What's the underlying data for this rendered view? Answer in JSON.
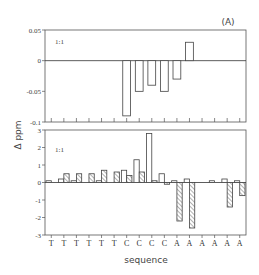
{
  "chart_data": [
    {
      "type": "bar",
      "title": "",
      "panel_label": "(A)",
      "annotation": "1:1",
      "xlabel": "",
      "ylabel": "Δ ppm",
      "ylim": [
        -0.1,
        0.05
      ],
      "yticks": [
        "0.05",
        "0",
        "-0.05",
        "-0.1"
      ],
      "categories": [
        "T",
        "T",
        "T",
        "T",
        "T",
        "T",
        "C",
        "C",
        "C",
        "C",
        "A",
        "A",
        "A",
        "A",
        "A",
        "A"
      ],
      "series": [
        {
          "name": "open",
          "style": "open",
          "values": [
            0,
            0,
            0,
            0,
            0,
            0,
            -0.09,
            -0.05,
            -0.04,
            -0.05,
            -0.03,
            0.03,
            0,
            0,
            0,
            0
          ]
        }
      ]
    },
    {
      "type": "bar",
      "title": "",
      "annotation": "1:1",
      "xlabel": "sequence",
      "ylabel": "Δ ppm",
      "ylim": [
        -3,
        3
      ],
      "yticks": [
        "3",
        "2",
        "1",
        "0",
        "-1",
        "-2",
        "-3"
      ],
      "categories": [
        "T",
        "T",
        "T",
        "T",
        "T",
        "T",
        "C",
        "C",
        "C",
        "C",
        "A",
        "A",
        "A",
        "A",
        "A",
        "A"
      ],
      "series": [
        {
          "name": "open",
          "style": "open",
          "values": [
            0.1,
            0.2,
            0.1,
            0,
            0.1,
            0,
            0.7,
            1.3,
            2.8,
            0.5,
            0.1,
            0.2,
            0,
            0.1,
            0.2,
            0.1
          ]
        },
        {
          "name": "hatched",
          "style": "hatched",
          "values": [
            0,
            0.5,
            0.5,
            0.5,
            0.7,
            0.6,
            0.4,
            0.6,
            0.1,
            -0.1,
            -2.2,
            -2.6,
            0,
            0,
            -1.4,
            -0.75
          ]
        }
      ]
    }
  ],
  "labels": {
    "panel": "(A)",
    "ratio_top": "1:1",
    "ratio_bottom": "1:1",
    "ylabel": "Δ ppm",
    "xlabel": "sequence"
  }
}
